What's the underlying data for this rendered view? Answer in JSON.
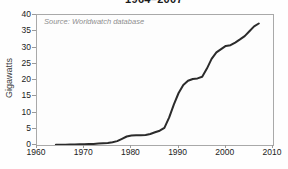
{
  "page": {
    "background_color": "#fefefe"
  },
  "chart": {
    "title_partial": "1964–2007",
    "source_note": "Source: Worldwatch database",
    "ylabel": "Gigawatts"
  },
  "chart_data": {
    "type": "line",
    "title": "1964–2007",
    "subtitle_note": "title partially cut off at top of image",
    "source": "Source: Worldwatch database",
    "xlabel": "",
    "ylabel": "Gigawatts",
    "xlim": [
      1960,
      2010
    ],
    "ylim": [
      0,
      40
    ],
    "xticks": [
      1960,
      1970,
      1980,
      1990,
      2000,
      2010
    ],
    "yticks": [
      0,
      5,
      10,
      15,
      20,
      25,
      30,
      35,
      40
    ],
    "grid": false,
    "legend": "none",
    "line_color": "#2b2b2b",
    "line_width": 2,
    "x": [
      1964,
      1965,
      1966,
      1967,
      1968,
      1969,
      1970,
      1971,
      1972,
      1973,
      1974,
      1975,
      1976,
      1977,
      1978,
      1979,
      1980,
      1981,
      1982,
      1983,
      1984,
      1985,
      1986,
      1987,
      1988,
      1989,
      1990,
      1991,
      1992,
      1993,
      1994,
      1995,
      1996,
      1997,
      1998,
      1999,
      2000,
      2001,
      2002,
      2003,
      2004,
      2005,
      2006,
      2007
    ],
    "y": [
      0.1,
      0.1,
      0.1,
      0.15,
      0.15,
      0.2,
      0.25,
      0.3,
      0.35,
      0.45,
      0.55,
      0.65,
      0.85,
      1.2,
      1.9,
      2.6,
      2.9,
      3.0,
      3.0,
      3.1,
      3.4,
      3.9,
      4.4,
      5.3,
      8.5,
      12.5,
      16.0,
      18.5,
      19.8,
      20.3,
      20.5,
      21.0,
      23.5,
      26.5,
      28.5,
      29.5,
      30.5,
      30.7,
      31.5,
      32.5,
      33.5,
      35.0,
      36.5,
      37.4
    ]
  }
}
